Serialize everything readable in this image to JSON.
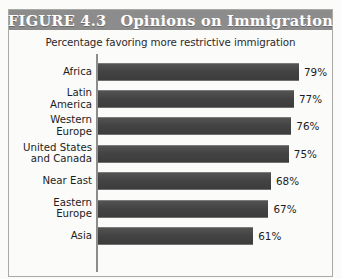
{
  "figure": {
    "number_label": "FIGURE 4.3",
    "title": "Opinions on Immigration",
    "subtitle": "Percentage favoring more restrictive immigration"
  },
  "colors": {
    "title_band": "#8c8c8c",
    "title_text": "#ffffff",
    "bar": "#4a4a4a",
    "axis": "#8d8d8b",
    "frame": "#a9a9a6",
    "background": "#fbfbfa"
  },
  "rows": [
    {
      "label": "Africa",
      "value_label": "79%"
    },
    {
      "label": "Latin\nAmerica",
      "value_label": "77%"
    },
    {
      "label": "Western\nEurope",
      "value_label": "76%"
    },
    {
      "label": "United States\nand Canada",
      "value_label": "75%"
    },
    {
      "label": "Near East",
      "value_label": "68%"
    },
    {
      "label": "Eastern\nEurope",
      "value_label": "67%"
    },
    {
      "label": "Asia",
      "value_label": "61%"
    }
  ],
  "chart_data": {
    "type": "bar",
    "orientation": "horizontal",
    "title": "Opinions on Immigration",
    "subtitle": "Percentage favoring more restrictive immigration",
    "xlabel": "",
    "ylabel": "",
    "categories": [
      "Africa",
      "Latin America",
      "Western Europe",
      "United States and Canada",
      "Near East",
      "Eastern Europe",
      "Asia"
    ],
    "values": [
      79,
      77,
      76,
      75,
      68,
      67,
      61
    ],
    "value_labels": [
      "79%",
      "77%",
      "76%",
      "75%",
      "68%",
      "67%",
      "61%"
    ],
    "units": "percent",
    "xlim": [
      0,
      79
    ],
    "grid": false,
    "legend": null,
    "axis_ticks": []
  }
}
